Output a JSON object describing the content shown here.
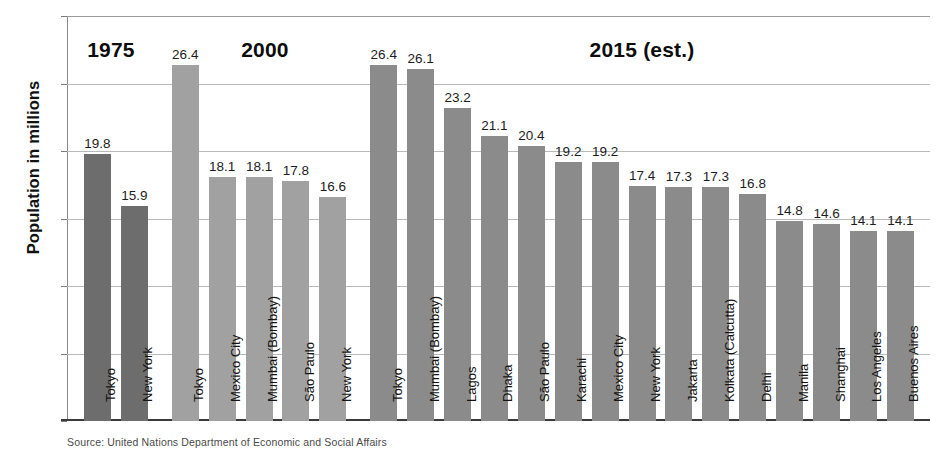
{
  "chart_data": {
    "type": "bar",
    "title": "",
    "xlabel": "",
    "ylabel": "Population in millions",
    "ylim": [
      0,
      30
    ],
    "yticks": [
      0,
      5,
      10,
      15,
      20,
      25,
      30
    ],
    "ytick_labels": [
      "0",
      "5",
      "10",
      "15",
      "20",
      "25",
      "30"
    ],
    "grid": true,
    "legend": "none",
    "value_label_format": "one-decimal",
    "groups": [
      {
        "name": "1975",
        "heading": "1975",
        "color": "#6d6d6d",
        "categories": [
          "Tokyo",
          "New York"
        ],
        "values": [
          19.8,
          15.9
        ],
        "value_labels": [
          "19.8",
          "15.9"
        ]
      },
      {
        "name": "2000",
        "heading": "2000",
        "color": "#a1a1a1",
        "categories": [
          "Tokyo",
          "Mexico City",
          "Mumbai (Bombay)",
          "São Paulo",
          "New York"
        ],
        "values": [
          26.4,
          18.1,
          18.1,
          17.8,
          16.6
        ],
        "value_labels": [
          "26.4",
          "18.1",
          "18.1",
          "17.8",
          "16.6"
        ]
      },
      {
        "name": "2015",
        "heading": "2015 (est.)",
        "color": "#8b8b8b",
        "categories": [
          "Tokyo",
          "Mumbai (Bombay)",
          "Lagos",
          "Dhaka",
          "São Paulo",
          "Karachi",
          "Mexico City",
          "New York",
          "Jakarta",
          "Kolkata (Calcutta)",
          "Delhi",
          "Manila",
          "Shanghai",
          "Los Angeles",
          "Buenos Aires"
        ],
        "values": [
          26.4,
          26.1,
          23.2,
          21.1,
          20.4,
          19.2,
          19.2,
          17.4,
          17.3,
          17.3,
          16.8,
          14.8,
          14.6,
          14.1,
          14.1
        ],
        "value_labels": [
          "26.4",
          "26.1",
          "23.2",
          "21.1",
          "20.4",
          "19.2",
          "19.2",
          "17.4",
          "17.3",
          "17.3",
          "16.8",
          "14.8",
          "14.6",
          "14.1",
          "14.1"
        ]
      }
    ]
  },
  "axis": {
    "y_title": "Population in millions"
  },
  "source": {
    "note": "Source:  United Nations Department of Economic and Social Affairs"
  }
}
